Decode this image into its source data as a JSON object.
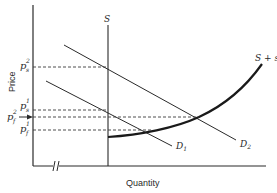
{
  "diagram": {
    "type": "supply-demand",
    "axes": {
      "ylabel": "Price",
      "xlabel": "Quantity",
      "x_axis_break": true
    },
    "curves": [
      {
        "id": "S",
        "label": "S",
        "kind": "vertical supply"
      },
      {
        "id": "S_plus_s",
        "label": "S + s",
        "kind": "upward-sloping supply"
      },
      {
        "id": "D1",
        "label": "D",
        "label_sub": "1",
        "kind": "demand"
      },
      {
        "id": "D2",
        "label": "D",
        "label_sub": "2",
        "kind": "demand"
      }
    ],
    "price_levels": [
      {
        "id": "ps2",
        "base": "p",
        "sup": "2",
        "sub": "s"
      },
      {
        "id": "ps1",
        "base": "p",
        "sup": "1",
        "sub": "s"
      },
      {
        "id": "pf2",
        "base": "p",
        "sup": "2",
        "sub": "f",
        "arrow": true
      },
      {
        "id": "pf1",
        "base": "p",
        "sup": "1",
        "sub": "f"
      }
    ]
  },
  "colors": {
    "ink": "#2a2a2a",
    "background": "#ffffff"
  }
}
